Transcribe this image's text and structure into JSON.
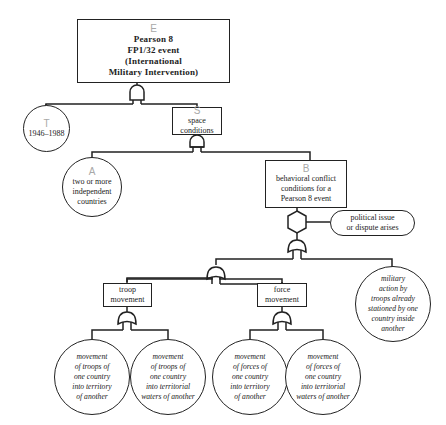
{
  "diagram": {
    "type": "fault-tree",
    "nodes": {
      "E": {
        "letter": "E",
        "lines": [
          "Pearson 8",
          "FP1/32  event",
          "(International",
          "Military  Intervention)"
        ]
      },
      "T": {
        "letter": "T",
        "lines": [
          "1946–1988"
        ]
      },
      "S": {
        "letter": "S",
        "lines": [
          "space",
          "conditions"
        ]
      },
      "A": {
        "letter": "A",
        "lines": [
          "two or more",
          "independent",
          "countries"
        ]
      },
      "B": {
        "letter": "B",
        "lines": [
          "behavioral conflict",
          "conditions for a",
          "Pearson 8 event"
        ]
      },
      "political": {
        "lines": [
          "political issue",
          "or dispute arises"
        ]
      },
      "military": {
        "lines": [
          "military",
          "action by",
          "troops already",
          "stationed by one",
          "country inside",
          "another"
        ]
      },
      "troop": {
        "lines": [
          "troop",
          "movement"
        ]
      },
      "force": {
        "lines": [
          "force",
          "movement"
        ]
      },
      "troop_territory": {
        "lines": [
          "movement",
          "of troops of",
          "one country",
          "into territory",
          "of another"
        ]
      },
      "troop_waters": {
        "lines": [
          "movement",
          "of troops of",
          "one country",
          "into territorial",
          "waters of another"
        ]
      },
      "force_territory": {
        "lines": [
          "movement",
          "of forces of",
          "one country",
          "into territory",
          "of another"
        ]
      },
      "force_waters": {
        "lines": [
          "movement",
          "of forces of",
          "one country",
          "into territorial",
          "waters of another"
        ]
      }
    },
    "gates": {
      "E_gate": "and",
      "S_gate": "and",
      "B_inhibit": "hexagon",
      "B_gate": "or",
      "movement_gate": "or",
      "troop_gate": "or",
      "force_gate": "or"
    },
    "colors": {
      "line": "#222222",
      "letter": "#a8a8a8",
      "background": "#ffffff"
    }
  }
}
